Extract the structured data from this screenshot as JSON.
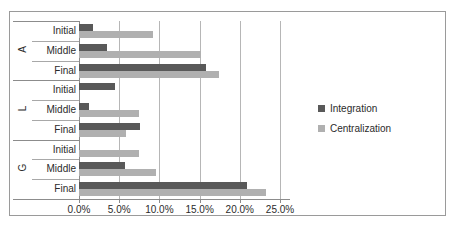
{
  "chart_data": {
    "type": "bar",
    "orientation": "horizontal",
    "title": "",
    "xlabel": "",
    "ylabel": "",
    "xlim": [
      0,
      25
    ],
    "xticks": [
      0,
      5,
      10,
      15,
      20,
      25
    ],
    "xtick_labels": [
      "0.0%",
      "5.0%",
      "10.0%",
      "15.0%",
      "20.0%",
      "25.0%"
    ],
    "grid": true,
    "legend_position": "right",
    "groups": [
      {
        "label": "A",
        "categories": [
          "Initial",
          "Middle",
          "Final"
        ]
      },
      {
        "label": "L",
        "categories": [
          "Initial",
          "Middle",
          "Final"
        ]
      },
      {
        "label": "G",
        "categories": [
          "Initial",
          "Middle",
          "Final"
        ]
      }
    ],
    "categories": [
      "A Initial",
      "A Middle",
      "A Final",
      "L Initial",
      "L Middle",
      "L Final",
      "G Initial",
      "G Middle",
      "G Final"
    ],
    "series": [
      {
        "name": "Integration",
        "color": "#595959",
        "values": [
          1.8,
          3.5,
          15.8,
          4.5,
          1.3,
          7.6,
          0.0,
          5.7,
          20.9
        ]
      },
      {
        "name": "Centralization",
        "color": "#b0b0b0",
        "values": [
          9.2,
          15.2,
          17.4,
          0.0,
          7.5,
          5.9,
          7.5,
          9.6,
          23.2
        ]
      }
    ]
  },
  "legend": {
    "items": [
      {
        "label": "Integration"
      },
      {
        "label": "Centralization"
      }
    ]
  }
}
